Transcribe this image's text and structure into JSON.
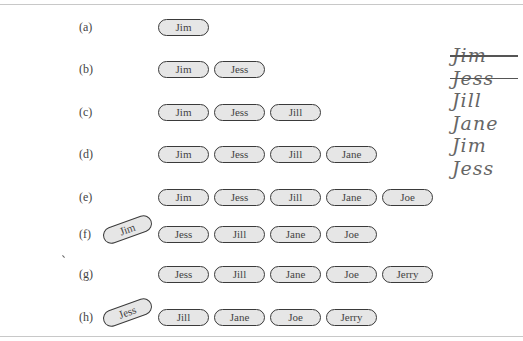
{
  "figure": {
    "rows": [
      {
        "label": "(a)",
        "rotated": null,
        "pills": [
          "Jim"
        ]
      },
      {
        "label": "(b)",
        "rotated": null,
        "pills": [
          "Jim",
          "Jess"
        ]
      },
      {
        "label": "(c)",
        "rotated": null,
        "pills": [
          "Jim",
          "Jess",
          "Jill"
        ]
      },
      {
        "label": "(d)",
        "rotated": null,
        "pills": [
          "Jim",
          "Jess",
          "Jill",
          "Jane"
        ]
      },
      {
        "label": "(e)",
        "rotated": null,
        "pills": [
          "Jim",
          "Jess",
          "Jill",
          "Jane",
          "Joe"
        ]
      },
      {
        "label": "(f)",
        "rotated": "Jim",
        "pills": [
          "Jess",
          "Jill",
          "Jane",
          "Joe"
        ]
      },
      {
        "label": "(g)",
        "rotated": null,
        "pills": [
          "Jess",
          "Jill",
          "Jane",
          "Joe",
          "Jerry"
        ]
      },
      {
        "label": "(h)",
        "rotated": "Jess",
        "pills": [
          "Jill",
          "Jane",
          "Joe",
          "Jerry"
        ]
      }
    ],
    "handwritten_notes": [
      {
        "text": "Jim",
        "struck": true
      },
      {
        "text": "Jess",
        "struck": true
      },
      {
        "text": "Jill",
        "struck": false
      },
      {
        "text": "Jane",
        "struck": false
      },
      {
        "text": "Jim",
        "struck": false
      },
      {
        "text": "Jess",
        "struck": false
      }
    ]
  }
}
